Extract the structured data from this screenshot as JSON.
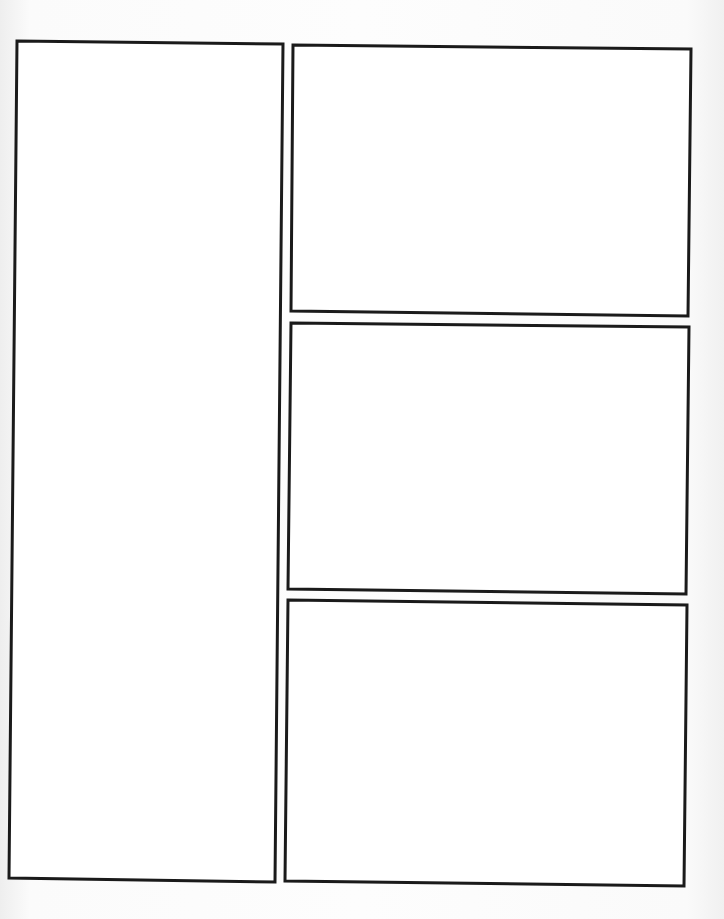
{
  "page": {
    "type": "comic-panel-template",
    "background_color": "#fbfbfb",
    "panel_border_color": "#1a1a1a",
    "panel_fill_color": "#ffffff"
  },
  "panels": [
    {
      "id": "panel-left-tall",
      "points": "17,41 283,44 275,882 9,878"
    },
    {
      "id": "panel-right-top",
      "points": "293,45 691,49 688,316 291,311"
    },
    {
      "id": "panel-right-middle",
      "points": "291,323 689,327 686,594 288,589"
    },
    {
      "id": "panel-right-bottom",
      "points": "288,600 687,605 684,886 285,881"
    }
  ]
}
